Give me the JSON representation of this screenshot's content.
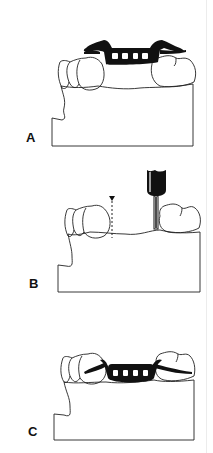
{
  "figure": {
    "panels": [
      {
        "label": "A",
        "description": "Cast with framework positioned over edentulous span"
      },
      {
        "label": "B",
        "description": "Cast with bur preparing tissue surface and dotted guide line"
      },
      {
        "label": "C",
        "description": "Cast with framework seated on prepared ridge"
      }
    ]
  },
  "colors": {
    "ink": "#111111",
    "background": "#ffffff"
  }
}
